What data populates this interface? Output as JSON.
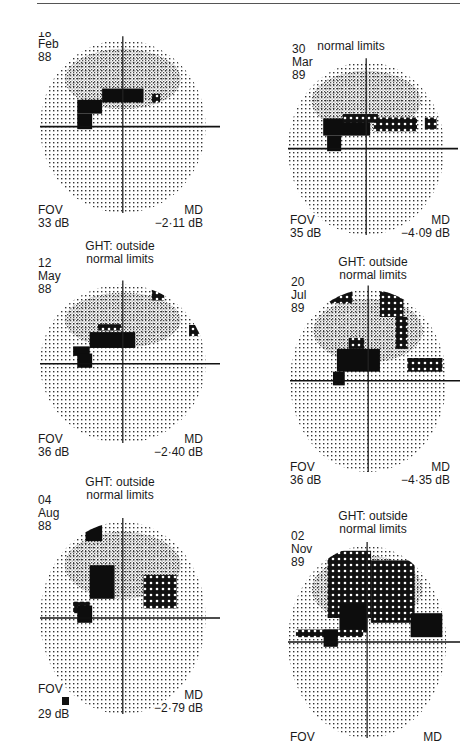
{
  "figure": {
    "panels": [
      {
        "id": "p1",
        "ght": [
          "",
          ""
        ],
        "date": [
          "18",
          "Feb",
          "88"
        ],
        "fov_label": "FOV",
        "fov_value": "33 dB",
        "md_label": "MD",
        "md_value": "−2·11 dB",
        "defects": [
          {
            "x": -0.55,
            "y": 0.15,
            "w": 0.3,
            "h": 0.16,
            "kind": "solid"
          },
          {
            "x": -0.25,
            "y": 0.28,
            "w": 0.5,
            "h": 0.16,
            "kind": "solid"
          },
          {
            "x": 0.35,
            "y": 0.28,
            "w": 0.1,
            "h": 0.1,
            "kind": "hatch"
          },
          {
            "x": -0.55,
            "y": -0.03,
            "w": 0.18,
            "h": 0.18,
            "kind": "solid"
          }
        ]
      },
      {
        "id": "p2",
        "ght": [
          "",
          "normal limits"
        ],
        "date": [
          "30",
          "Mar",
          "89"
        ],
        "fov_label": "FOV",
        "fov_value": "35 dB",
        "md_label": "MD",
        "md_value": "−4·09 dB",
        "defects": [
          {
            "x": -0.55,
            "y": 0.15,
            "w": 0.6,
            "h": 0.2,
            "kind": "solid"
          },
          {
            "x": -0.3,
            "y": 0.3,
            "w": 0.45,
            "h": 0.1,
            "kind": "hatch"
          },
          {
            "x": 0.1,
            "y": 0.2,
            "w": 0.55,
            "h": 0.16,
            "kind": "hatch"
          },
          {
            "x": 0.75,
            "y": 0.22,
            "w": 0.15,
            "h": 0.14,
            "kind": "hatch"
          },
          {
            "x": -0.5,
            "y": -0.03,
            "w": 0.18,
            "h": 0.18,
            "kind": "solid"
          }
        ]
      },
      {
        "id": "p3",
        "ght": [
          "GHT: outside",
          "normal limits"
        ],
        "date": [
          "12",
          "May",
          "88"
        ],
        "fov_label": "FOV",
        "fov_value": "36 dB",
        "md_label": "MD",
        "md_value": "−2·40 dB",
        "defects": [
          {
            "x": -0.6,
            "y": 0.1,
            "w": 0.2,
            "h": 0.12,
            "kind": "solid"
          },
          {
            "x": -0.4,
            "y": 0.2,
            "w": 0.55,
            "h": 0.2,
            "kind": "solid"
          },
          {
            "x": -0.3,
            "y": 0.42,
            "w": 0.28,
            "h": 0.08,
            "kind": "hatch"
          },
          {
            "x": 0.35,
            "y": 0.8,
            "w": 0.15,
            "h": 0.14,
            "kind": "hatch"
          },
          {
            "x": 0.8,
            "y": 0.35,
            "w": 0.15,
            "h": 0.14,
            "kind": "hatch"
          },
          {
            "x": -0.55,
            "y": -0.05,
            "w": 0.18,
            "h": 0.18,
            "kind": "solid"
          }
        ]
      },
      {
        "id": "p4",
        "ght": [
          "GHT: outside",
          "normal limits"
        ],
        "date": [
          "20",
          "Jul",
          "89"
        ],
        "fov_label": "FOV",
        "fov_value": "36 dB",
        "md_label": "MD",
        "md_value": "−4·35 dB",
        "defects": [
          {
            "x": -0.55,
            "y": 0.85,
            "w": 0.35,
            "h": 0.14,
            "kind": "hatch"
          },
          {
            "x": 0.15,
            "y": 0.7,
            "w": 0.3,
            "h": 0.28,
            "kind": "hatch"
          },
          {
            "x": 0.35,
            "y": 0.35,
            "w": 0.15,
            "h": 0.35,
            "kind": "hatch"
          },
          {
            "x": -0.4,
            "y": 0.1,
            "w": 0.55,
            "h": 0.25,
            "kind": "solid"
          },
          {
            "x": -0.25,
            "y": 0.35,
            "w": 0.2,
            "h": 0.12,
            "kind": "hatch"
          },
          {
            "x": 0.5,
            "y": 0.1,
            "w": 0.45,
            "h": 0.15,
            "kind": "hatch"
          },
          {
            "x": -0.45,
            "y": -0.05,
            "w": 0.15,
            "h": 0.15,
            "kind": "solid"
          }
        ]
      },
      {
        "id": "p5",
        "ght": [
          "GHT: outside",
          "normal limits"
        ],
        "date": [
          "04",
          "Aug",
          "88"
        ],
        "fov_label": "FOV",
        "fov_value": "29 dB",
        "md_label": "MD",
        "md_value": "−2·79 dB",
        "defects": [
          {
            "x": -0.45,
            "y": 0.8,
            "w": 0.2,
            "h": 0.22,
            "kind": "solid"
          },
          {
            "x": -0.4,
            "y": 0.2,
            "w": 0.3,
            "h": 0.35,
            "kind": "solid"
          },
          {
            "x": 0.25,
            "y": 0.1,
            "w": 0.4,
            "h": 0.35,
            "kind": "hatch"
          },
          {
            "x": -0.6,
            "y": 0.05,
            "w": 0.2,
            "h": 0.12,
            "kind": "hatch"
          },
          {
            "x": -0.55,
            "y": -0.05,
            "w": 0.18,
            "h": 0.18,
            "kind": "solid"
          }
        ]
      },
      {
        "id": "p6",
        "ght": [
          "GHT: outside",
          "normal limits"
        ],
        "date": [
          "02",
          "Nov",
          "89"
        ],
        "fov_label": "FOV",
        "fov_value": "",
        "md_label": "MD",
        "md_value": "",
        "defects": [
          {
            "x": -0.5,
            "y": 0.25,
            "w": 0.55,
            "h": 0.7,
            "kind": "hatch"
          },
          {
            "x": 0.05,
            "y": 0.2,
            "w": 0.55,
            "h": 0.65,
            "kind": "hatch"
          },
          {
            "x": -0.35,
            "y": 0.1,
            "w": 0.35,
            "h": 0.3,
            "kind": "solid"
          },
          {
            "x": -0.9,
            "y": 0.05,
            "w": 0.85,
            "h": 0.08,
            "kind": "hatch"
          },
          {
            "x": 0.55,
            "y": 0.05,
            "w": 0.4,
            "h": 0.25,
            "kind": "solid"
          },
          {
            "x": -0.55,
            "y": -0.05,
            "w": 0.18,
            "h": 0.18,
            "kind": "solid"
          }
        ]
      }
    ]
  }
}
